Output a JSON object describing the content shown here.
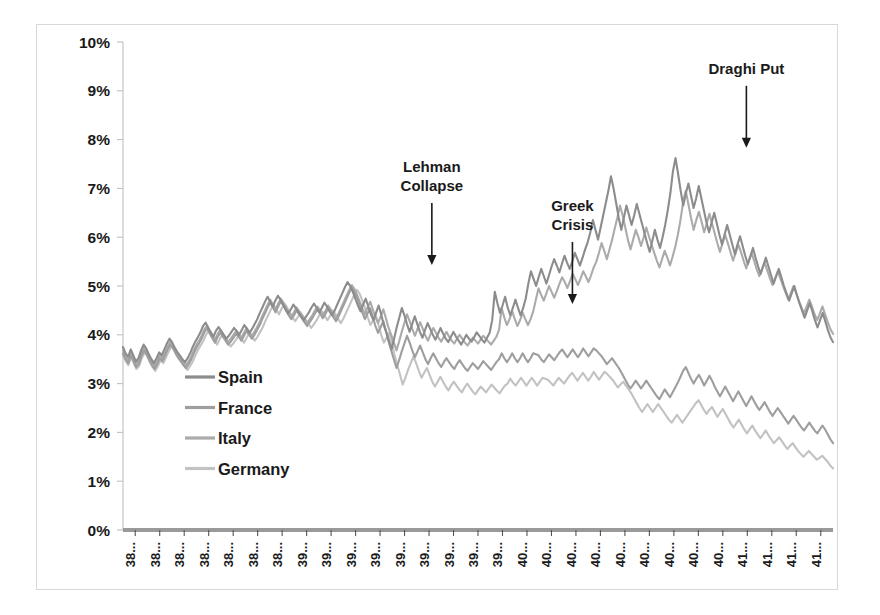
{
  "figure": {
    "background": "#ffffff",
    "border_color": "#d8d8d8"
  },
  "chart_data": {
    "type": "line",
    "title": "",
    "subtitle": "",
    "xlabel": "",
    "ylabel": "",
    "ylim": [
      0,
      10
    ],
    "yunit": "%",
    "grid": false,
    "legend_position": "inside-left-lower",
    "ytick_labels": [
      "10%",
      "9%",
      "8%",
      "7%",
      "6%",
      "5%",
      "4%",
      "3%",
      "2%",
      "1%",
      "0%"
    ],
    "ytick_values": [
      10,
      9,
      8,
      7,
      6,
      5,
      4,
      3,
      2,
      1,
      0
    ],
    "xtick_labels": [
      "38...",
      "38...",
      "38...",
      "38...",
      "38...",
      "38...",
      "38...",
      "39...",
      "39...",
      "39...",
      "39...",
      "39...",
      "39...",
      "39...",
      "39...",
      "39...",
      "40...",
      "40...",
      "40...",
      "40...",
      "40...",
      "40...",
      "40...",
      "40...",
      "40...",
      "41...",
      "41...",
      "41...",
      "41..."
    ],
    "legend": [
      {
        "name": "Spain",
        "color": "#8c8c8c"
      },
      {
        "name": "France",
        "color": "#9e9e9e"
      },
      {
        "name": "Italy",
        "color": "#ababab"
      },
      {
        "name": "Germany",
        "color": "#c2c2c2"
      }
    ],
    "annotations": [
      {
        "label": "Lehman Collapse",
        "lines": [
          "Lehman",
          "Collapse"
        ],
        "x_frac": 0.435,
        "y_value": 5.35
      },
      {
        "label": "Greek Crisis",
        "lines": [
          "Greek",
          "Crisis"
        ],
        "x_frac": 0.633,
        "y_value": 4.55
      },
      {
        "label": "Draghi Put",
        "lines": [
          "Draghi Put"
        ],
        "x_frac": 0.878,
        "y_value": 7.75
      }
    ],
    "series": [
      {
        "name": "Spain",
        "color": "#8c8c8c",
        "values": [
          3.75,
          3.62,
          3.55,
          3.7,
          3.58,
          3.45,
          3.52,
          3.68,
          3.8,
          3.72,
          3.6,
          3.5,
          3.42,
          3.52,
          3.64,
          3.58,
          3.7,
          3.82,
          3.92,
          3.85,
          3.74,
          3.65,
          3.58,
          3.5,
          3.44,
          3.52,
          3.62,
          3.75,
          3.86,
          3.95,
          4.05,
          4.18,
          4.25,
          4.14,
          4.05,
          3.96,
          4.08,
          4.16,
          4.08,
          4.0,
          3.92,
          3.98,
          4.06,
          4.14,
          4.08,
          4.0,
          4.1,
          4.2,
          4.12,
          4.04,
          4.12,
          4.22,
          4.32,
          4.45,
          4.56,
          4.68,
          4.78,
          4.68,
          4.58,
          4.7,
          4.8,
          4.72,
          4.62,
          4.52,
          4.44,
          4.52,
          4.62,
          4.54,
          4.46,
          4.38,
          4.3,
          4.38,
          4.46,
          4.56,
          4.64,
          4.55,
          4.46,
          4.55,
          4.66,
          4.58,
          4.48,
          4.4,
          4.5,
          4.62,
          4.74,
          4.86,
          4.98,
          5.08,
          5.0,
          4.88,
          4.74,
          4.6,
          4.48,
          4.62,
          4.74,
          4.58,
          4.42,
          4.3,
          4.45,
          4.6,
          4.42,
          4.2,
          4.05,
          3.88,
          3.7,
          3.92,
          4.15,
          4.35,
          4.55,
          4.4,
          4.22,
          4.06,
          4.22,
          4.38,
          4.22,
          4.06,
          3.94,
          4.1,
          4.24,
          4.12,
          4.0,
          3.9,
          4.02,
          4.14,
          4.02,
          3.92,
          3.85,
          3.96,
          4.06,
          3.96,
          3.88,
          3.8,
          3.9,
          4.0,
          3.92,
          3.86,
          3.95,
          4.05,
          3.98,
          3.9,
          3.84,
          3.94,
          4.04,
          4.3,
          4.88,
          4.65,
          4.45,
          4.6,
          4.78,
          4.56,
          4.4,
          4.55,
          4.72,
          4.55,
          4.4,
          4.55,
          4.75,
          5.05,
          5.3,
          5.15,
          5.0,
          5.18,
          5.35,
          5.2,
          5.05,
          5.22,
          5.4,
          5.55,
          5.42,
          5.28,
          5.45,
          5.62,
          5.48,
          5.35,
          5.5,
          5.68,
          5.55,
          5.42,
          5.58,
          5.75,
          5.9,
          6.1,
          6.35,
          6.15,
          5.95,
          6.2,
          6.45,
          6.7,
          6.95,
          7.25,
          7.0,
          6.7,
          6.4,
          6.15,
          6.4,
          6.65,
          6.45,
          6.25,
          6.45,
          6.68,
          6.48,
          6.28,
          6.08,
          5.88,
          5.7,
          5.92,
          6.15,
          5.95,
          5.78,
          6.0,
          6.25,
          6.55,
          6.9,
          7.35,
          7.62,
          7.3,
          6.95,
          6.65,
          6.9,
          7.1,
          6.85,
          6.6,
          6.8,
          7.05,
          6.8,
          6.55,
          6.3,
          6.1,
          6.3,
          6.5,
          6.28,
          6.05,
          5.85,
          6.05,
          6.25,
          6.05,
          5.85,
          5.65,
          5.85,
          6.02,
          5.82,
          5.62,
          5.45,
          5.6,
          5.78,
          5.58,
          5.4,
          5.25,
          5.42,
          5.58,
          5.4,
          5.22,
          5.05,
          5.2,
          5.35,
          5.18,
          5.0,
          4.85,
          4.7,
          4.85,
          5.0,
          4.82,
          4.65,
          4.5,
          4.35,
          4.5,
          4.65,
          4.48,
          4.3,
          4.15,
          4.3,
          4.45,
          4.28,
          4.1,
          3.95,
          3.85
        ]
      },
      {
        "name": "Italy",
        "color": "#ababab",
        "values": [
          3.68,
          3.56,
          3.48,
          3.64,
          3.52,
          3.4,
          3.46,
          3.62,
          3.74,
          3.66,
          3.54,
          3.44,
          3.36,
          3.46,
          3.58,
          3.52,
          3.64,
          3.76,
          3.86,
          3.79,
          3.68,
          3.59,
          3.52,
          3.44,
          3.38,
          3.46,
          3.56,
          3.69,
          3.8,
          3.89,
          3.99,
          4.12,
          4.19,
          4.08,
          3.99,
          3.9,
          4.02,
          4.1,
          4.02,
          3.94,
          3.86,
          3.92,
          4.0,
          4.08,
          4.02,
          3.94,
          4.04,
          4.14,
          4.06,
          3.98,
          4.06,
          4.16,
          4.26,
          4.39,
          4.5,
          4.62,
          4.72,
          4.62,
          4.52,
          4.64,
          4.74,
          4.66,
          4.56,
          4.46,
          4.38,
          4.46,
          4.56,
          4.48,
          4.4,
          4.32,
          4.24,
          4.32,
          4.4,
          4.5,
          4.58,
          4.49,
          4.4,
          4.49,
          4.6,
          4.52,
          4.42,
          4.34,
          4.44,
          4.56,
          4.68,
          4.8,
          4.92,
          5.02,
          4.94,
          4.82,
          4.68,
          4.54,
          4.42,
          4.56,
          4.68,
          4.52,
          4.36,
          4.24,
          4.38,
          4.52,
          4.34,
          4.14,
          4.0,
          3.84,
          3.68,
          3.86,
          4.06,
          4.24,
          4.42,
          4.28,
          4.12,
          3.98,
          4.12,
          4.26,
          4.12,
          3.98,
          3.88,
          4.02,
          4.14,
          4.04,
          3.94,
          3.86,
          3.96,
          4.06,
          3.96,
          3.88,
          3.82,
          3.92,
          4.0,
          3.92,
          3.84,
          3.78,
          3.86,
          3.94,
          3.88,
          3.82,
          3.9,
          3.98,
          3.92,
          3.86,
          3.8,
          3.88,
          3.96,
          4.1,
          4.55,
          4.35,
          4.2,
          4.32,
          4.48,
          4.32,
          4.18,
          4.3,
          4.45,
          4.32,
          4.2,
          4.32,
          4.48,
          4.72,
          4.95,
          4.82,
          4.7,
          4.85,
          5.0,
          4.88,
          4.76,
          4.9,
          5.05,
          5.18,
          5.08,
          4.96,
          5.1,
          5.25,
          5.14,
          5.02,
          5.15,
          5.3,
          5.2,
          5.08,
          5.22,
          5.38,
          5.5,
          5.68,
          5.88,
          5.72,
          5.55,
          5.75,
          5.95,
          6.18,
          6.4,
          6.65,
          6.45,
          6.2,
          5.95,
          5.75,
          5.95,
          6.15,
          6.0,
          5.82,
          6.0,
          6.2,
          6.02,
          5.85,
          5.68,
          5.52,
          5.38,
          5.55,
          5.72,
          5.58,
          5.42,
          5.6,
          5.8,
          6.05,
          6.35,
          6.72,
          6.95,
          6.68,
          6.4,
          6.15,
          6.35,
          6.52,
          6.32,
          6.1,
          6.28,
          6.48,
          6.28,
          6.08,
          5.88,
          5.7,
          5.88,
          6.05,
          5.88,
          5.7,
          5.52,
          5.68,
          5.85,
          5.7,
          5.52,
          5.36,
          5.52,
          5.68,
          5.52,
          5.34,
          5.2,
          5.34,
          5.48,
          5.32,
          5.16,
          5.02,
          5.16,
          5.3,
          5.15,
          5.0,
          4.86,
          4.72,
          4.86,
          5.0,
          4.85,
          4.7,
          4.56,
          4.44,
          4.58,
          4.72,
          4.58,
          4.42,
          4.3,
          4.44,
          4.58,
          4.42,
          4.26,
          4.12,
          4.02
        ]
      },
      {
        "name": "France",
        "color": "#9e9e9e",
        "values": [
          3.62,
          3.5,
          3.42,
          3.58,
          3.46,
          3.34,
          3.4,
          3.56,
          3.68,
          3.6,
          3.48,
          3.38,
          3.3,
          3.4,
          3.52,
          3.46,
          3.58,
          3.7,
          3.8,
          3.73,
          3.62,
          3.53,
          3.46,
          3.38,
          3.32,
          3.4,
          3.5,
          3.63,
          3.74,
          3.83,
          3.93,
          4.06,
          4.13,
          4.02,
          3.93,
          3.84,
          3.96,
          4.04,
          3.96,
          3.88,
          3.8,
          3.86,
          3.94,
          4.02,
          3.96,
          3.88,
          3.98,
          4.08,
          4.0,
          3.92,
          4.0,
          4.1,
          4.2,
          4.33,
          4.44,
          4.56,
          4.66,
          4.56,
          4.46,
          4.58,
          4.68,
          4.6,
          4.5,
          4.4,
          4.32,
          4.4,
          4.5,
          4.42,
          4.34,
          4.26,
          4.18,
          4.26,
          4.34,
          4.44,
          4.52,
          4.43,
          4.34,
          4.43,
          4.54,
          4.46,
          4.36,
          4.28,
          4.38,
          4.5,
          4.62,
          4.74,
          4.86,
          4.96,
          4.88,
          4.76,
          4.62,
          4.46,
          4.32,
          4.44,
          4.54,
          4.36,
          4.18,
          4.04,
          4.16,
          4.28,
          4.08,
          3.86,
          3.68,
          3.5,
          3.32,
          3.48,
          3.66,
          3.82,
          3.98,
          3.84,
          3.68,
          3.54,
          3.66,
          3.78,
          3.64,
          3.5,
          3.4,
          3.52,
          3.62,
          3.52,
          3.42,
          3.34,
          3.44,
          3.52,
          3.44,
          3.36,
          3.3,
          3.4,
          3.48,
          3.4,
          3.32,
          3.26,
          3.34,
          3.42,
          3.36,
          3.3,
          3.38,
          3.46,
          3.4,
          3.34,
          3.28,
          3.36,
          3.44,
          3.5,
          3.62,
          3.52,
          3.44,
          3.52,
          3.62,
          3.52,
          3.44,
          3.52,
          3.62,
          3.52,
          3.44,
          3.52,
          3.62,
          3.6,
          3.58,
          3.5,
          3.44,
          3.52,
          3.6,
          3.54,
          3.48,
          3.56,
          3.64,
          3.7,
          3.62,
          3.54,
          3.62,
          3.7,
          3.62,
          3.54,
          3.62,
          3.72,
          3.64,
          3.56,
          3.64,
          3.72,
          3.68,
          3.62,
          3.56,
          3.48,
          3.4,
          3.46,
          3.52,
          3.44,
          3.36,
          3.28,
          3.18,
          3.08,
          2.98,
          2.9,
          2.98,
          3.06,
          2.98,
          2.9,
          2.98,
          3.06,
          2.98,
          2.9,
          2.82,
          2.74,
          2.68,
          2.78,
          2.88,
          2.8,
          2.72,
          2.82,
          2.92,
          3.02,
          3.14,
          3.26,
          3.34,
          3.22,
          3.1,
          3.0,
          3.1,
          3.18,
          3.08,
          2.96,
          3.06,
          3.16,
          3.06,
          2.94,
          2.84,
          2.74,
          2.84,
          2.94,
          2.84,
          2.74,
          2.64,
          2.74,
          2.84,
          2.74,
          2.64,
          2.54,
          2.64,
          2.74,
          2.64,
          2.54,
          2.46,
          2.54,
          2.62,
          2.52,
          2.42,
          2.34,
          2.42,
          2.5,
          2.42,
          2.34,
          2.26,
          2.18,
          2.26,
          2.34,
          2.26,
          2.18,
          2.1,
          2.04,
          2.12,
          2.2,
          2.12,
          2.04,
          1.98,
          2.06,
          2.14,
          2.06,
          1.96,
          1.86,
          1.78
        ]
      },
      {
        "name": "Germany",
        "color": "#c2c2c2",
        "values": [
          3.58,
          3.46,
          3.38,
          3.54,
          3.42,
          3.3,
          3.36,
          3.52,
          3.64,
          3.56,
          3.44,
          3.34,
          3.26,
          3.36,
          3.48,
          3.42,
          3.54,
          3.66,
          3.76,
          3.69,
          3.58,
          3.49,
          3.42,
          3.34,
          3.28,
          3.36,
          3.46,
          3.59,
          3.7,
          3.79,
          3.89,
          4.02,
          4.09,
          3.98,
          3.89,
          3.8,
          3.92,
          4.0,
          3.92,
          3.84,
          3.76,
          3.82,
          3.9,
          3.98,
          3.92,
          3.84,
          3.94,
          4.04,
          3.96,
          3.88,
          3.96,
          4.06,
          4.16,
          4.29,
          4.4,
          4.52,
          4.62,
          4.52,
          4.42,
          4.54,
          4.64,
          4.56,
          4.46,
          4.36,
          4.28,
          4.36,
          4.46,
          4.38,
          4.3,
          4.22,
          4.14,
          4.22,
          4.3,
          4.4,
          4.48,
          4.39,
          4.3,
          4.39,
          4.5,
          4.42,
          4.32,
          4.24,
          4.34,
          4.46,
          4.58,
          4.7,
          4.82,
          4.92,
          4.84,
          4.7,
          4.54,
          4.36,
          4.2,
          4.3,
          4.4,
          4.2,
          4.0,
          3.84,
          3.94,
          4.04,
          3.82,
          3.58,
          3.38,
          3.18,
          2.98,
          3.12,
          3.28,
          3.42,
          3.56,
          3.42,
          3.26,
          3.12,
          3.22,
          3.32,
          3.18,
          3.04,
          2.94,
          3.04,
          3.14,
          3.04,
          2.94,
          2.86,
          2.96,
          3.04,
          2.96,
          2.88,
          2.82,
          2.92,
          3.0,
          2.92,
          2.84,
          2.78,
          2.86,
          2.94,
          2.88,
          2.82,
          2.9,
          2.98,
          2.92,
          2.86,
          2.8,
          2.88,
          2.96,
          3.0,
          3.1,
          3.02,
          2.96,
          3.04,
          3.12,
          3.04,
          2.96,
          3.04,
          3.12,
          3.04,
          2.96,
          3.04,
          3.12,
          3.1,
          3.08,
          3.02,
          2.96,
          3.04,
          3.12,
          3.06,
          3.0,
          3.08,
          3.16,
          3.22,
          3.14,
          3.06,
          3.14,
          3.22,
          3.14,
          3.06,
          3.14,
          3.24,
          3.16,
          3.08,
          3.16,
          3.24,
          3.2,
          3.14,
          3.08,
          3.0,
          2.92,
          2.98,
          3.04,
          2.96,
          2.88,
          2.8,
          2.7,
          2.6,
          2.5,
          2.42,
          2.5,
          2.58,
          2.5,
          2.42,
          2.5,
          2.58,
          2.5,
          2.42,
          2.34,
          2.26,
          2.2,
          2.28,
          2.36,
          2.28,
          2.2,
          2.28,
          2.36,
          2.44,
          2.52,
          2.6,
          2.66,
          2.56,
          2.46,
          2.38,
          2.46,
          2.52,
          2.42,
          2.32,
          2.4,
          2.48,
          2.38,
          2.28,
          2.18,
          2.1,
          2.18,
          2.26,
          2.16,
          2.06,
          1.98,
          2.06,
          2.14,
          2.04,
          1.96,
          1.88,
          1.96,
          2.04,
          1.94,
          1.86,
          1.78,
          1.84,
          1.9,
          1.82,
          1.74,
          1.66,
          1.72,
          1.78,
          1.7,
          1.62,
          1.56,
          1.5,
          1.56,
          1.62,
          1.56,
          1.5,
          1.44,
          1.48,
          1.52,
          1.46,
          1.4,
          1.32,
          1.26
        ]
      }
    ]
  }
}
